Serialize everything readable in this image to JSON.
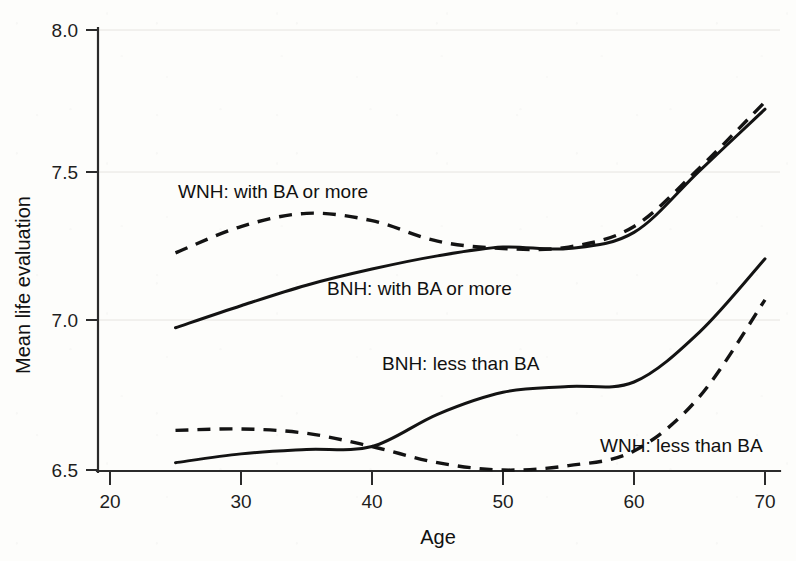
{
  "chart_data": {
    "type": "line",
    "title": "",
    "xlabel": "Age",
    "ylabel": "Mean life evaluation",
    "xlim": [
      20,
      70
    ],
    "ylim": [
      6.5,
      8.0
    ],
    "xticks": [
      20,
      30,
      40,
      50,
      60,
      70
    ],
    "xtick_labels": [
      "20",
      "30",
      "40",
      "50",
      "60",
      "70"
    ],
    "yticks": [
      6.5,
      7.0,
      7.5,
      8.0
    ],
    "ytick_labels": [
      "6.5",
      "7.0",
      "7.5",
      "8.0"
    ],
    "grid": false,
    "legend_position": "inline-annotations",
    "line_color": "#131313",
    "x": [
      25,
      30,
      35,
      40,
      45,
      50,
      55,
      60,
      65,
      70
    ],
    "series": [
      {
        "name": "WNH: with BA or more",
        "style": "dashed",
        "label_text": "WNH: with BA or more",
        "values": [
          7.24,
          7.33,
          7.375,
          7.35,
          7.28,
          7.255,
          7.26,
          7.33,
          7.53,
          7.755
        ]
      },
      {
        "name": "BNH: with BA or more",
        "style": "solid",
        "label_text": "BNH: with BA or more",
        "values": [
          6.985,
          7.06,
          7.13,
          7.185,
          7.23,
          7.26,
          7.255,
          7.31,
          7.52,
          7.73
        ]
      },
      {
        "name": "BNH: less than BA",
        "style": "solid",
        "label_text": "BNH: less than BA",
        "values": [
          6.525,
          6.555,
          6.57,
          6.58,
          6.69,
          6.765,
          6.785,
          6.8,
          6.97,
          7.22
        ]
      },
      {
        "name": "WNH: less than BA",
        "style": "dashed",
        "label_text": "WNH: less than BA",
        "values": [
          6.635,
          6.64,
          6.625,
          6.58,
          6.525,
          6.5,
          6.515,
          6.565,
          6.75,
          7.08
        ]
      }
    ],
    "annotations": [
      {
        "text": "WNH: with BA or more",
        "x_px": 178,
        "y_px": 198
      },
      {
        "text": "BNH: with BA or more",
        "x_px": 327,
        "y_px": 295
      },
      {
        "text": "BNH: less than BA",
        "x_px": 382,
        "y_px": 370
      },
      {
        "text": "WNH: less than BA",
        "x_px": 600,
        "y_px": 452
      }
    ]
  }
}
